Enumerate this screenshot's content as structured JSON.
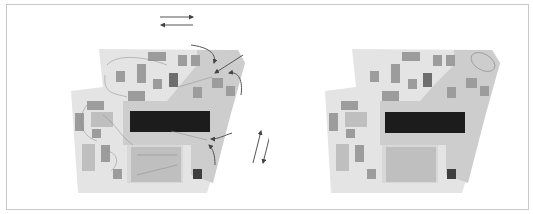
{
  "diagram": {
    "type": "site-plan-comparison",
    "panels": [
      {
        "id": "left",
        "label": "",
        "annotated": true,
        "flow_arrows": [
          "horizontal-pair-top",
          "diagonal-pair-right",
          "curved-arrows-northeast",
          "curved-arrows-east"
        ]
      },
      {
        "id": "right",
        "label": "",
        "annotated": false
      }
    ],
    "colors": {
      "frame_border": "#c8c8c8",
      "site_light": "#e6e6e6",
      "site_mid": "#cfcfcf",
      "block_medium": "#9a9a9a",
      "block_dark": "#4a4a4a",
      "central_block": "#1f1f1f",
      "arrow": "#555555"
    }
  }
}
